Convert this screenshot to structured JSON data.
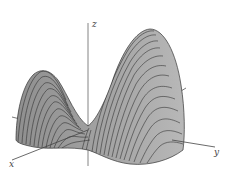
{
  "figure": {
    "type": "3d-surface-plot",
    "axes": {
      "x_label": "x",
      "y_label": "y",
      "z_label": "z"
    },
    "colors": {
      "surface_fill": "#9a9a9a",
      "surface_light": "#b5b5b5",
      "trace_lines": "#2a2a2a",
      "axis_lines": "#555555",
      "background": "#ffffff"
    }
  }
}
